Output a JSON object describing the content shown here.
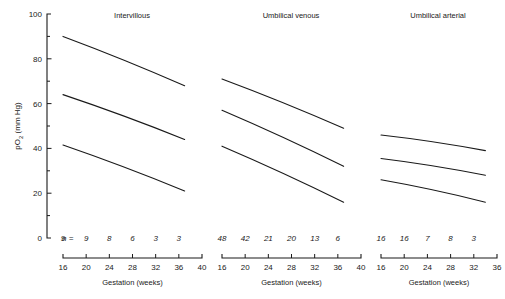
{
  "figure": {
    "y_axis": {
      "label": "pO2 (mm Hg)",
      "label_main": "pO",
      "label_sub": "2",
      "label_unit": " (mm Hg)",
      "ticks_major": [
        "0",
        "20",
        "40",
        "60",
        "80",
        "100"
      ],
      "ticks_major_values": [
        0,
        20,
        40,
        60,
        80,
        100
      ],
      "ticks_minor_values": [
        10,
        30,
        50,
        70,
        90
      ],
      "min": 0,
      "max": 100
    },
    "n_prefix": "n  =",
    "axis_title": "Gestation (weeks)",
    "line_color": "#1a1a1a"
  },
  "chart_data": [
    {
      "type": "line",
      "title": "Intervillous",
      "xlabel": "Gestation (weeks)",
      "ylabel": "pO2 (mm Hg)",
      "xlim": [
        16,
        40
      ],
      "ylim": [
        0,
        100
      ],
      "xticks": [
        16,
        20,
        24,
        28,
        32,
        36,
        40
      ],
      "xtick_labels": [
        "16",
        "20",
        "24",
        "28",
        "32",
        "36",
        "40"
      ],
      "grid": false,
      "legend": "none",
      "n_label_x": [
        16,
        20,
        24,
        28,
        32,
        36
      ],
      "n_values": [
        "9",
        "9",
        "8",
        "6",
        "3",
        "3"
      ],
      "x": [
        16,
        37
      ],
      "series": [
        {
          "name": "upper",
          "values": [
            90,
            68
          ]
        },
        {
          "name": "middle",
          "values": [
            64,
            44
          ]
        },
        {
          "name": "lower",
          "values": [
            41.5,
            21
          ]
        }
      ]
    },
    {
      "type": "line",
      "title": "Umbilical venous",
      "xlabel": "Gestation (weeks)",
      "ylabel": "pO2 (mm Hg)",
      "xlim": [
        16,
        40
      ],
      "ylim": [
        0,
        100
      ],
      "xticks": [
        16,
        20,
        24,
        28,
        32,
        36,
        40
      ],
      "xtick_labels": [
        "16",
        "20",
        "24",
        "28",
        "32",
        "36",
        "40"
      ],
      "grid": false,
      "legend": "none",
      "n_label_x": [
        16,
        20,
        24,
        28,
        32,
        36
      ],
      "n_values": [
        "48",
        "42",
        "21",
        "20",
        "13",
        "6"
      ],
      "x": [
        16,
        37
      ],
      "series": [
        {
          "name": "upper",
          "values": [
            71,
            49
          ]
        },
        {
          "name": "middle",
          "values": [
            57,
            32
          ]
        },
        {
          "name": "lower",
          "values": [
            41,
            16
          ]
        }
      ]
    },
    {
      "type": "line",
      "title": "Umbilical arterial",
      "xlabel": "Gestation (weeks)",
      "ylabel": "pO2 (mm Hg)",
      "xlim": [
        16,
        36
      ],
      "ylim": [
        0,
        100
      ],
      "xticks": [
        16,
        20,
        24,
        28,
        32,
        36
      ],
      "xtick_labels": [
        "16",
        "20",
        "24",
        "28",
        "32",
        "36"
      ],
      "grid": false,
      "legend": "none",
      "n_label_x": [
        16,
        20,
        24,
        28,
        32
      ],
      "n_values": [
        "16",
        "16",
        "7",
        "8",
        "3"
      ],
      "x": [
        16,
        34
      ],
      "series": [
        {
          "name": "upper",
          "values": [
            46,
            39
          ]
        },
        {
          "name": "middle",
          "values": [
            35.5,
            28
          ]
        },
        {
          "name": "lower",
          "values": [
            26,
            16
          ]
        }
      ]
    }
  ]
}
